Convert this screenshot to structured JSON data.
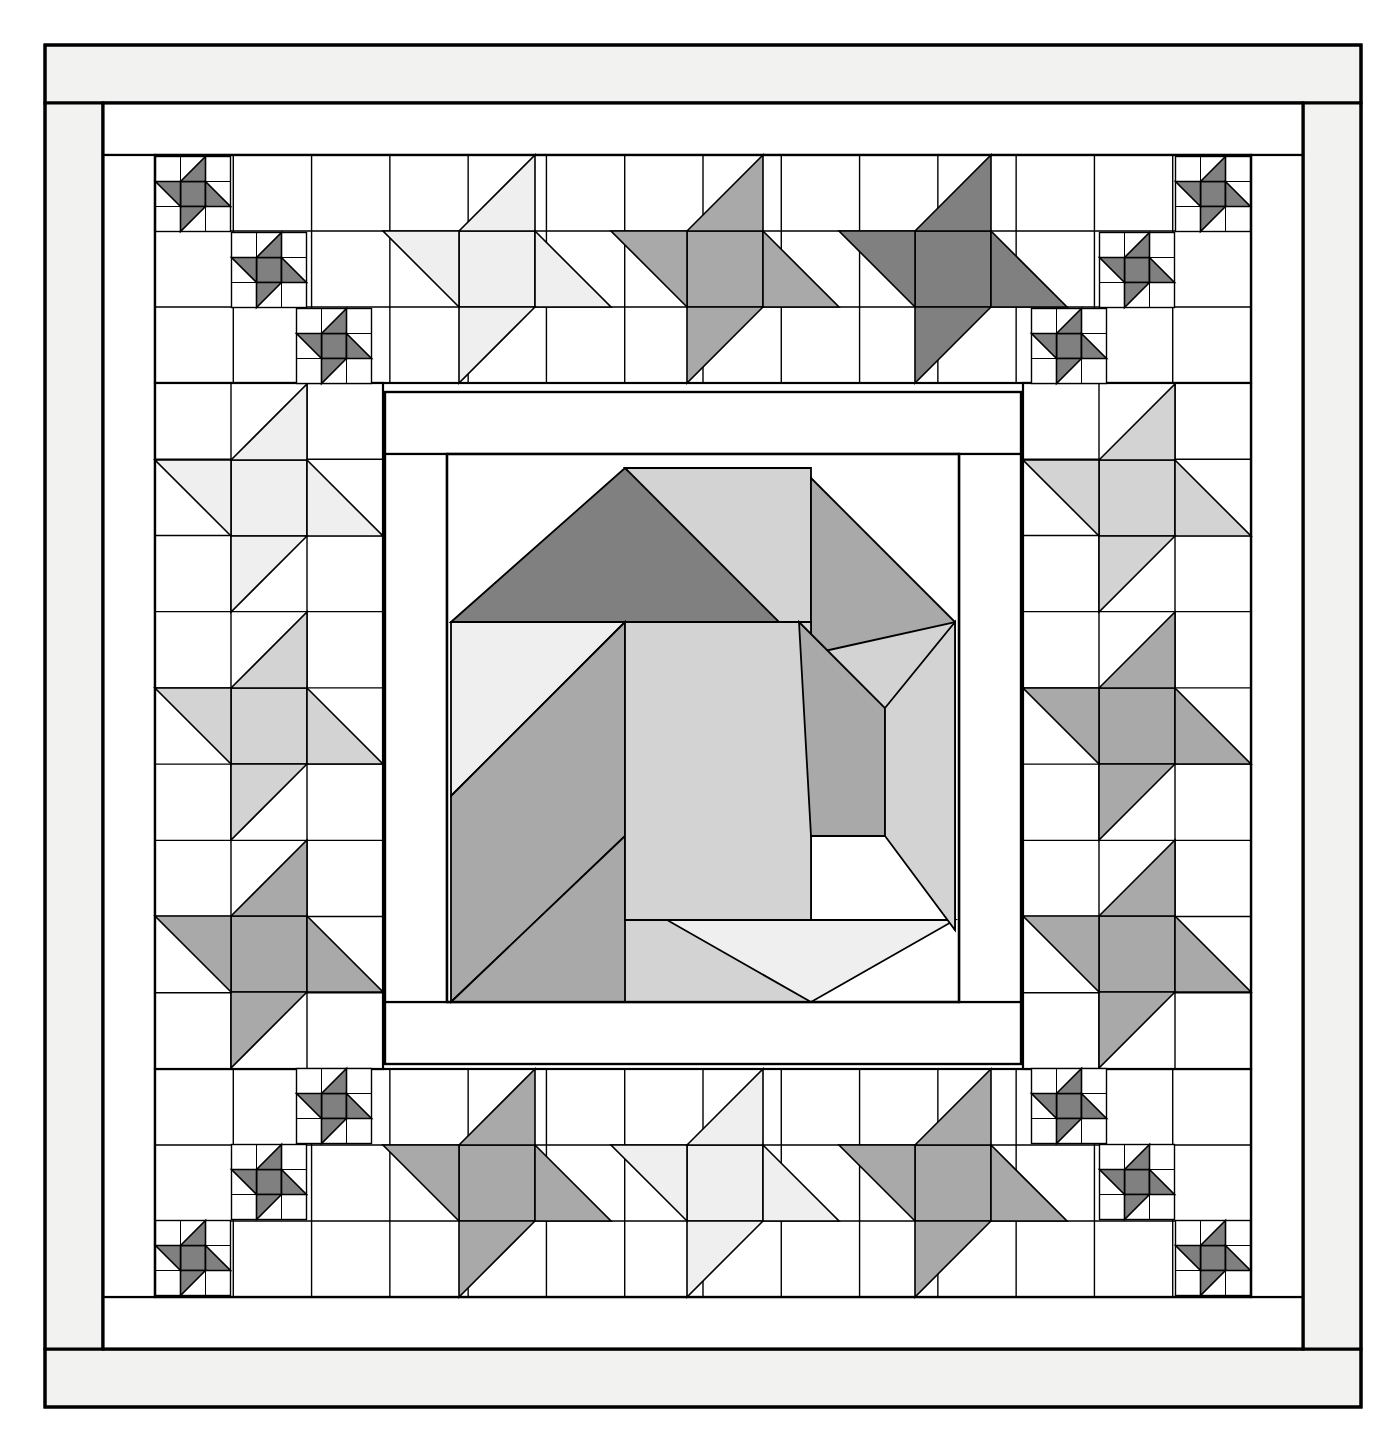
{
  "document": {
    "title": "Medallion Quilt Pattern Diagram",
    "type": "quilt-block-line-drawing",
    "canvas": {
      "width": 1396,
      "height": 1444,
      "background": "#ffffff"
    }
  },
  "palette": {
    "background": "#ffffff",
    "outline": "#000000",
    "fabric_white": "#ffffff",
    "fabric_offwhite": "#f2f2f0",
    "fabric_very_light": "#efefef",
    "fabric_light": "#d3d3d3",
    "fabric_medium": "#a9a9a9",
    "fabric_dark": "#808080"
  },
  "line": {
    "outer_width": 3.0,
    "block_width": 2.2,
    "patch_width": 1.6
  },
  "layout": {
    "outer_border": {
      "x": 45,
      "y": 45,
      "width": 1316,
      "height": 1362,
      "band": 58,
      "fill": "#f2f2f0"
    },
    "inner_frame": {
      "x": 103,
      "y": 103,
      "width": 1200,
      "height": 1246,
      "band": 52,
      "fill": "#ffffff"
    },
    "pieced_border_ring": {
      "x": 155,
      "y": 155,
      "width": 1096,
      "height": 1142
    },
    "sashing_ring": {
      "x": 385,
      "y": 392,
      "width": 636,
      "height": 672,
      "band": 62,
      "fill": "#ffffff"
    },
    "center_block": {
      "x": 447,
      "y": 454,
      "width": 512,
      "height": 548
    },
    "unit": 76
  },
  "center_block": {
    "name": "card-trick-pinwheel-medallion",
    "patch_count": 12,
    "patches": [
      {
        "name": "top-dark-triangle",
        "shade": "fabric_dark",
        "points": "451,622 625,468 799,622"
      },
      {
        "name": "top-right-light-wedge",
        "shade": "fabric_light",
        "points": "625,468 811,468 811,654"
      },
      {
        "name": "right-medium-triangle",
        "shade": "fabric_medium",
        "points": "811,478 955,622 811,766"
      },
      {
        "name": "right-light-wedge",
        "shade": "fabric_light",
        "points": "811,654 955,622 955,930"
      },
      {
        "name": "left-verylight-square",
        "shade": "fabric_very_light",
        "points": "451,622 625,622 451,796"
      },
      {
        "name": "left-medium-chevron",
        "shade": "fabric_medium",
        "points": "451,796 625,622 625,836 451,1002"
      },
      {
        "name": "bottom-medium-wedge",
        "shade": "fabric_medium",
        "points": "451,1002 625,836 799,1002"
      },
      {
        "name": "bottom-light-blade",
        "shade": "fabric_light",
        "points": "625,836 811,836 811,1002 625,1002"
      },
      {
        "name": "bottom-right-verylight",
        "shade": "fabric_very_light",
        "points": "667,920 955,920 811,1002"
      },
      {
        "name": "center-light-square",
        "shade": "fabric_light",
        "points": "625,622 811,622 811,920 625,920"
      },
      {
        "name": "inner-medium-blade",
        "shade": "fabric_medium",
        "points": "799,622 885,708 885,836 811,836"
      },
      {
        "name": "inner-light-return",
        "shade": "fabric_light",
        "points": "885,708 955,622 955,930 885,836"
      }
    ]
  },
  "border": {
    "description": "Pieced ring of friendship-star (pinwheel) blocks with small 3x3 pinwheel stars in the corners.",
    "large_star_unit": 76,
    "small_star_unit": 25,
    "top_row": {
      "label": "top-pieced-border",
      "blocks": [
        {
          "name": "star-top-1",
          "shade": "fabric_very_light",
          "cx": 497,
          "cy": 269,
          "rotation": 0
        },
        {
          "name": "star-top-2",
          "shade": "fabric_medium",
          "cx": 725,
          "cy": 269,
          "rotation": 0
        },
        {
          "name": "star-top-3",
          "shade": "fabric_dark",
          "cx": 953,
          "cy": 269,
          "rotation": 0
        }
      ]
    },
    "bottom_row": {
      "label": "bottom-pieced-border",
      "blocks": [
        {
          "name": "star-bottom-1",
          "shade": "fabric_medium",
          "cx": 497,
          "cy": 1183,
          "rotation": 180
        },
        {
          "name": "star-bottom-2",
          "shade": "fabric_very_light",
          "cx": 725,
          "cy": 1183,
          "rotation": 180
        },
        {
          "name": "star-bottom-3",
          "shade": "fabric_medium",
          "cx": 953,
          "cy": 1183,
          "rotation": 180
        }
      ]
    },
    "left_column": {
      "label": "left-pieced-border",
      "blocks": [
        {
          "name": "star-left-1",
          "shade": "fabric_very_light",
          "cx": 269,
          "cy": 498,
          "rotation": 0
        },
        {
          "name": "star-left-2",
          "shade": "fabric_light",
          "cx": 269,
          "cy": 726,
          "rotation": 0
        },
        {
          "name": "star-left-3",
          "shade": "fabric_medium",
          "cx": 269,
          "cy": 954,
          "rotation": 0
        }
      ]
    },
    "right_column": {
      "label": "right-pieced-border",
      "blocks": [
        {
          "name": "star-right-1",
          "shade": "fabric_light",
          "cx": 1137,
          "cy": 498,
          "rotation": 0
        },
        {
          "name": "star-right-2",
          "shade": "fabric_medium",
          "cx": 1137,
          "cy": 726,
          "rotation": 0
        },
        {
          "name": "star-right-3",
          "shade": "fabric_medium",
          "cx": 1137,
          "cy": 954,
          "rotation": 0
        }
      ]
    },
    "corner_small_stars": {
      "label": "corner-mini-pinwheel-stars",
      "shade": "fabric_dark",
      "unit": 25,
      "stars": [
        {
          "name": "mini-star-tl-a",
          "cx": 193,
          "cy": 194
        },
        {
          "name": "mini-star-tl-b",
          "cx": 269,
          "cy": 270
        },
        {
          "name": "mini-star-tl-c",
          "cx": 334,
          "cy": 346
        },
        {
          "name": "mini-star-tr-a",
          "cx": 1213,
          "cy": 194
        },
        {
          "name": "mini-star-tr-b",
          "cx": 1137,
          "cy": 270
        },
        {
          "name": "mini-star-tr-c",
          "cx": 1069,
          "cy": 346
        },
        {
          "name": "mini-star-bl-a",
          "cx": 193,
          "cy": 1258
        },
        {
          "name": "mini-star-bl-b",
          "cx": 269,
          "cy": 1182
        },
        {
          "name": "mini-star-bl-c",
          "cx": 334,
          "cy": 1106
        },
        {
          "name": "mini-star-br-a",
          "cx": 1213,
          "cy": 1258
        },
        {
          "name": "mini-star-br-b",
          "cx": 1137,
          "cy": 1182
        },
        {
          "name": "mini-star-br-c",
          "cx": 1069,
          "cy": 1106
        }
      ]
    }
  },
  "grid_lines": {
    "top_band": {
      "y0": 155,
      "y1": 383,
      "x0": 155,
      "x1": 1251,
      "rows": 3
    },
    "bottom_band": {
      "y0": 1069,
      "y1": 1297,
      "x0": 155,
      "x1": 1251,
      "rows": 3
    },
    "left_band": {
      "x0": 155,
      "x1": 383,
      "y0": 383,
      "y1": 1069,
      "cols": 3
    },
    "right_band": {
      "x0": 1023,
      "x1": 1251,
      "y0": 383,
      "y1": 1069,
      "cols": 3
    }
  }
}
